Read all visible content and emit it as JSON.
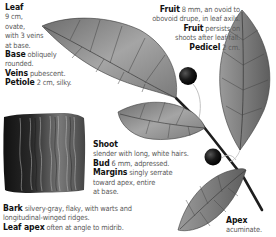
{
  "leaf": {
    "title": "Leaf",
    "lines": [
      "9 cm,",
      "ovate,",
      "with 3 veins",
      "at base."
    ],
    "base_label": "Base",
    "base_text": " obliquely",
    "base_text2": "rounded.",
    "veins_label": "Veins",
    "veins_text": " pubescent.",
    "petiole_label": "Petiole",
    "petiole_text": " 2 cm, silky."
  },
  "fruit": {
    "label": "Fruit",
    "text1": " 8 mm, an ovoid to",
    "text2": "obovoid drupe, in leaf axils.",
    "label2": "Fruit",
    "text3": " persists on",
    "text4": "shoots after leaf-fall.",
    "pedicel_label": "Pedicel",
    "pedicel_text": " 2 cm."
  },
  "shoot": {
    "label": "Shoot",
    "text": "slender with long, white hairs.",
    "bud_label": "Bud",
    "bud_text": " 6 mm, adpressed.",
    "margins_label": "Margins",
    "margins_text": " singly serrate",
    "margins_text2": "toward apex, entire",
    "margins_text3": "at base."
  },
  "bark": {
    "label": "Bark",
    "text": " silvery-gray, flaky, with warts and",
    "text2": "longitudinal-winged ridges."
  },
  "leaf_apex": {
    "label": "Leaf apex",
    "text": " often at angle to midrib."
  },
  "apex": {
    "label": "Apex",
    "text": "acuminate."
  },
  "colors": {
    "text_body": "#5a5a5a",
    "text_label": "#111111",
    "fruit": "#1a1a1a",
    "leaf": "#8a8a8a"
  }
}
